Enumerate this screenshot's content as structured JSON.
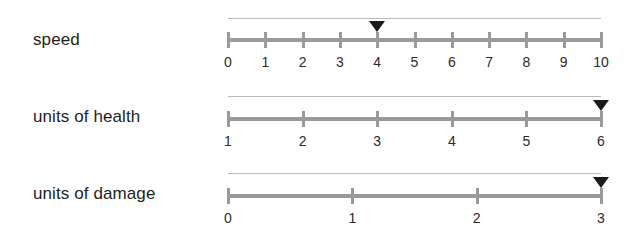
{
  "layout": {
    "track_left": 228,
    "track_right": 601,
    "background_color": "#ffffff",
    "track_color": "#9a9a9c",
    "hairline_color": "#b9b9bb",
    "marker_color": "#1b1b1b",
    "label_color": "#231f20",
    "tick_label_color": "#2c2a2b"
  },
  "sliders": [
    {
      "label": "speed",
      "label_top": 31,
      "hairline_top": 18,
      "track_top": 38,
      "tick_top": 32,
      "tick_height": 16,
      "tick_label_top": 55,
      "marker_top": 21,
      "ticks": [
        "0",
        "1",
        "2",
        "3",
        "4",
        "5",
        "6",
        "7",
        "8",
        "9",
        "10"
      ],
      "min": 0,
      "max": 10,
      "value": 4,
      "marker_index": 4
    },
    {
      "label": "units of health",
      "label_top": 108,
      "hairline_top": 96,
      "track_top": 117,
      "tick_top": 111,
      "tick_height": 16,
      "tick_label_top": 134,
      "marker_top": 100,
      "ticks": [
        "1",
        "2",
        "3",
        "4",
        "5",
        "6"
      ],
      "min": 1,
      "max": 6,
      "value": 6,
      "marker_index": 5
    },
    {
      "label": "units of damage",
      "label_top": 185,
      "hairline_top": 173,
      "track_top": 194,
      "tick_top": 188,
      "tick_height": 16,
      "tick_label_top": 211,
      "marker_top": 177,
      "ticks": [
        "0",
        "1",
        "2",
        "3"
      ],
      "min": 0,
      "max": 3,
      "value": 3,
      "marker_index": 3
    }
  ]
}
